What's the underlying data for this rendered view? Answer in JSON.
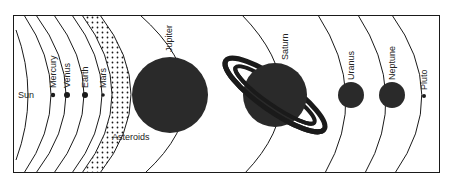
{
  "diagram": {
    "title": "",
    "colors": {
      "ink": "#1a1a1a",
      "planet_fill": "#2a2a2a",
      "background": "#ffffff"
    },
    "sun": {
      "label": "Sun"
    },
    "planets": [
      {
        "name": "Mercury",
        "label": "Mercury",
        "size": "tiny"
      },
      {
        "name": "Venus",
        "label": "Venus",
        "size": "small"
      },
      {
        "name": "Earth",
        "label": "Earth",
        "size": "small"
      },
      {
        "name": "Mars",
        "label": "Mars",
        "size": "tiny"
      },
      {
        "name": "Jupiter",
        "label": "Jupiter",
        "size": "large"
      },
      {
        "name": "Saturn",
        "label": "Saturn",
        "size": "large",
        "rings": true
      },
      {
        "name": "Uranus",
        "label": "Uranus",
        "size": "medium"
      },
      {
        "name": "Neptune",
        "label": "Neptune",
        "size": "medium"
      },
      {
        "name": "Pluto",
        "label": "Pluto",
        "size": "tiny"
      }
    ],
    "asteroid_belt": {
      "label": "Asteroids"
    }
  }
}
